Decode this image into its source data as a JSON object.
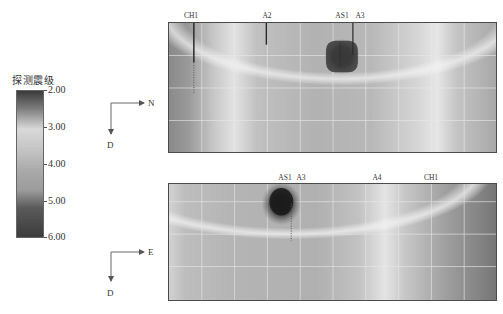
{
  "colorbar": {
    "title": "探测震级",
    "ticks": [
      "2.00",
      "3.00",
      "4.00",
      "5.00",
      "6.00"
    ],
    "range": [
      2.0,
      6.0
    ]
  },
  "panels": [
    {
      "id": "top",
      "axes": {
        "horizontal": "N",
        "vertical": "D"
      },
      "well_labels": [
        "CH1",
        "A2",
        "AS1",
        "A3"
      ]
    },
    {
      "id": "bottom",
      "axes": {
        "horizontal": "E",
        "vertical": "D"
      },
      "well_labels": [
        "AS1",
        "A3",
        "A4",
        "CH1"
      ]
    }
  ]
}
